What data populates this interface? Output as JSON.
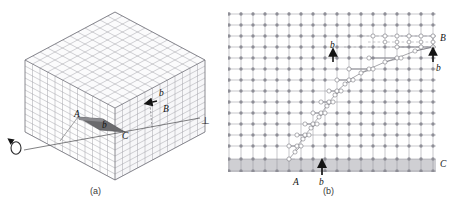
{
  "figure": {
    "type": "scientific-illustration",
    "background_color": "#ffffff",
    "lattice_line_color": "#8e8e96",
    "atom_color": "#8a8a93",
    "slip_plane_color": "#6f6f72",
    "label_color": "#141414",
    "panels": [
      {
        "id": "a",
        "caption": "(a)",
        "caption_x": 97,
        "caption_y": 192,
        "labels": [
          {
            "text": "A",
            "x": 77,
            "y": 114
          },
          {
            "text": "b",
            "x": 105,
            "y": 125
          },
          {
            "text": "C",
            "x": 120,
            "y": 135
          },
          {
            "text": "b",
            "x": 157,
            "y": 92
          },
          {
            "text": "B",
            "x": 165,
            "y": 106
          }
        ],
        "symbols": [
          {
            "name": "burgers-circuit-loop-icon",
            "x": 16,
            "y": 147
          },
          {
            "name": "perpendicular-dislocation-icon",
            "text": "⊥",
            "x": 205,
            "y": 121
          }
        ],
        "grid_divisions": 12
      },
      {
        "id": "b",
        "caption": "(b)",
        "caption_x": 330,
        "caption_y": 192,
        "labels": [
          {
            "text": "B",
            "x": 443,
            "y": 38
          },
          {
            "text": "b",
            "x": 439,
            "y": 64
          },
          {
            "text": "b",
            "x": 335,
            "y": 47
          },
          {
            "text": "A",
            "x": 298,
            "y": 183
          },
          {
            "text": "b",
            "x": 322,
            "y": 183
          },
          {
            "text": "C",
            "x": 441,
            "y": 164
          }
        ],
        "grid_columns": 17,
        "grid_rows": 15,
        "shaded_band_label": "slipped-region-band"
      }
    ]
  }
}
